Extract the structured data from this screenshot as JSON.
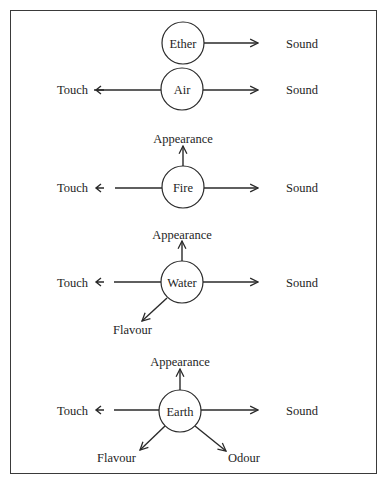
{
  "diagram": {
    "type": "element-to-sense-quality diagram",
    "rows": [
      {
        "element": "Ether",
        "center": [
          183,
          43
        ],
        "line_y": 43,
        "qualities": {
          "right": "Sound"
        }
      },
      {
        "element": "Air",
        "center": [
          182,
          89
        ],
        "line_y": 90,
        "qualities": {
          "left": "Touch",
          "right": "Sound"
        }
      },
      {
        "element": "Fire",
        "center": [
          183,
          187
        ],
        "line_y": 188,
        "qualities": {
          "up": "Appearance",
          "left": "Touch",
          "right": "Sound"
        }
      },
      {
        "element": "Water",
        "center": [
          182,
          282
        ],
        "line_y": 282,
        "qualities": {
          "up": "Appearance",
          "left": "Touch",
          "right": "Sound",
          "down_left": "Flavour"
        }
      },
      {
        "element": "Earth",
        "center": [
          180,
          411
        ],
        "line_y": 410,
        "qualities": {
          "up": "Appearance",
          "left": "Touch",
          "right": "Sound",
          "down_left": "Flavour",
          "down_right": "Odour"
        }
      }
    ],
    "colors": {
      "stroke": "#2a2a2a",
      "text": "#1e1e1e",
      "background": "#ffffff",
      "frame": "#3a3a3a"
    }
  }
}
